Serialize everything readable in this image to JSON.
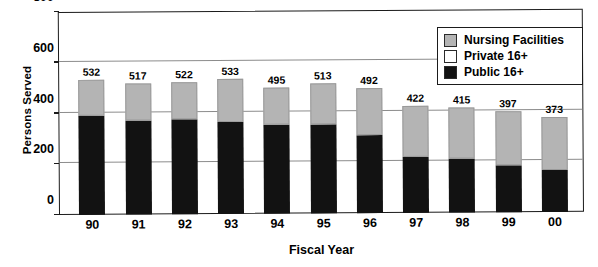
{
  "chart_data": {
    "type": "bar",
    "subtype": "stacked",
    "title": "",
    "xlabel": "Fiscal Year",
    "ylabel": "Persons Served",
    "categories": [
      "90",
      "91",
      "92",
      "93",
      "94",
      "95",
      "96",
      "97",
      "98",
      "99",
      "00"
    ],
    "totals": [
      532,
      517,
      522,
      533,
      495,
      513,
      492,
      422,
      415,
      397,
      373
    ],
    "series": [
      {
        "name": "Public 16+",
        "color": "#121212",
        "values": [
          390,
          372,
          375,
          362,
          352,
          352,
          308,
          222,
          212,
          185,
          165
        ]
      },
      {
        "name": "Private 16+",
        "color": "#ffffff",
        "values": [
          0,
          0,
          0,
          0,
          0,
          0,
          0,
          0,
          0,
          0,
          0
        ]
      },
      {
        "name": "Nursing Facilities",
        "color": "#b4b4b4",
        "values": [
          142,
          145,
          147,
          171,
          143,
          161,
          184,
          200,
          203,
          212,
          208
        ]
      }
    ],
    "ylim": [
      0,
      800
    ],
    "yticks": [
      0,
      200,
      400,
      600,
      800
    ],
    "ytick_labels": [
      "0",
      "200",
      "400",
      "600",
      "800"
    ],
    "grid": true,
    "grid_axis": "y",
    "legend_position": "upper-right",
    "legend_entries": [
      {
        "label": "Nursing Facilities",
        "color": "#b4b4b4"
      },
      {
        "label": "Private 16+",
        "color": "#ffffff"
      },
      {
        "label": "Public 16+",
        "color": "#121212"
      }
    ],
    "value_labels": [
      "532",
      "517",
      "522",
      "533",
      "495",
      "513",
      "492",
      "422",
      "415",
      "397",
      "373"
    ]
  }
}
